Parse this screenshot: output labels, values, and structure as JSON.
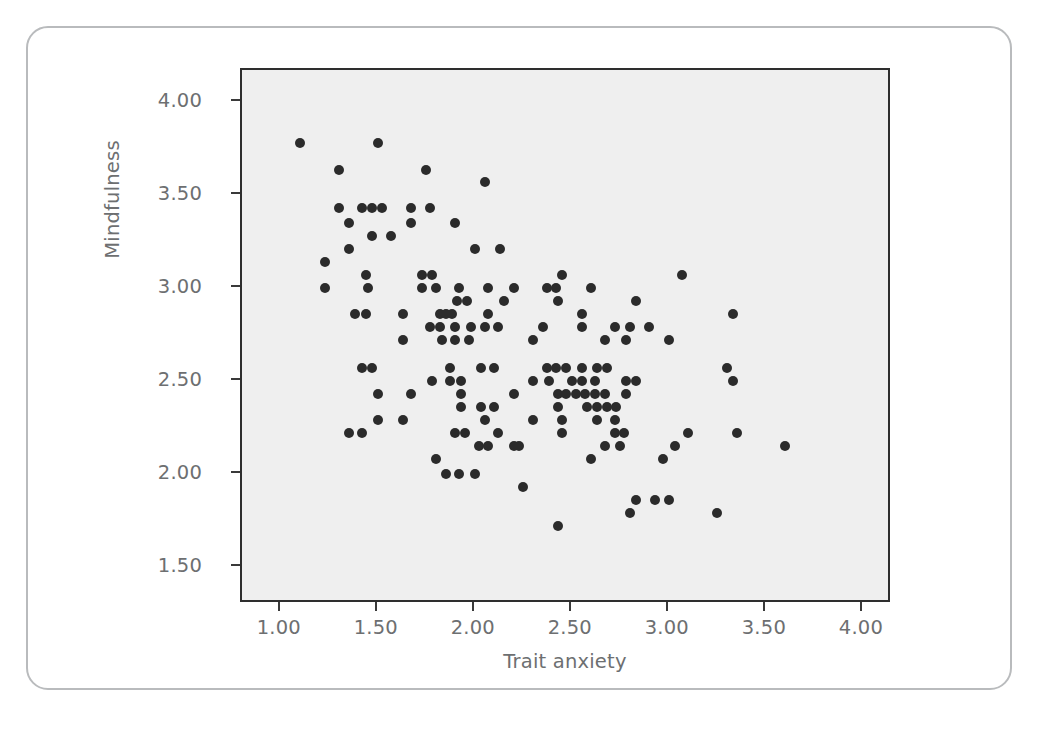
{
  "figure": {
    "background_color": "#ffffff",
    "card_border_color": "#b9bbbd",
    "plot_background_color": "#efefef",
    "axis_color": "#2e2e2e",
    "tick_label_color": "#6d6f71",
    "point_color": "#2b2b2b"
  },
  "chart_data": {
    "type": "scatter",
    "title": "",
    "subtitle": "",
    "xlabel": "Trait anxiety",
    "ylabel": "Mindfulness",
    "xlim": [
      0.8,
      4.15
    ],
    "ylim": [
      1.3,
      4.17
    ],
    "xticks": [
      1.0,
      1.5,
      2.0,
      2.5,
      3.0,
      3.5,
      4.0
    ],
    "xticklabels": [
      "1.00",
      "1.50",
      "2.00",
      "2.50",
      "3.00",
      "3.50",
      "4.00"
    ],
    "yticks": [
      1.5,
      2.0,
      2.5,
      3.0,
      3.5,
      4.0
    ],
    "yticklabels": [
      "1.50",
      "2.00",
      "2.50",
      "3.00",
      "3.50",
      "4.00"
    ],
    "grid": false,
    "legend": null,
    "marker": "circle",
    "marker_size": 10,
    "n_points": 148,
    "points": [
      [
        1.1,
        3.78
      ],
      [
        1.5,
        3.78
      ],
      [
        1.3,
        3.63
      ],
      [
        1.75,
        3.63
      ],
      [
        2.05,
        3.57
      ],
      [
        1.3,
        3.43
      ],
      [
        1.42,
        3.43
      ],
      [
        1.47,
        3.43
      ],
      [
        1.52,
        3.43
      ],
      [
        1.67,
        3.43
      ],
      [
        1.77,
        3.43
      ],
      [
        1.35,
        3.35
      ],
      [
        1.67,
        3.35
      ],
      [
        1.9,
        3.35
      ],
      [
        1.47,
        3.28
      ],
      [
        1.57,
        3.28
      ],
      [
        1.35,
        3.21
      ],
      [
        2.0,
        3.21
      ],
      [
        2.13,
        3.21
      ],
      [
        1.23,
        3.14
      ],
      [
        1.44,
        3.07
      ],
      [
        1.73,
        3.07
      ],
      [
        1.78,
        3.07
      ],
      [
        2.45,
        3.07
      ],
      [
        3.07,
        3.07
      ],
      [
        1.23,
        3.0
      ],
      [
        1.45,
        3.0
      ],
      [
        1.73,
        3.0
      ],
      [
        1.8,
        3.0
      ],
      [
        1.92,
        3.0
      ],
      [
        2.07,
        3.0
      ],
      [
        2.2,
        3.0
      ],
      [
        2.37,
        3.0
      ],
      [
        2.42,
        3.0
      ],
      [
        2.6,
        3.0
      ],
      [
        1.91,
        2.93
      ],
      [
        1.96,
        2.93
      ],
      [
        2.15,
        2.93
      ],
      [
        2.43,
        2.93
      ],
      [
        2.83,
        2.93
      ],
      [
        1.38,
        2.86
      ],
      [
        1.44,
        2.86
      ],
      [
        1.63,
        2.86
      ],
      [
        1.82,
        2.86
      ],
      [
        1.85,
        2.86
      ],
      [
        1.88,
        2.86
      ],
      [
        2.07,
        2.86
      ],
      [
        2.55,
        2.86
      ],
      [
        3.33,
        2.86
      ],
      [
        1.77,
        2.79
      ],
      [
        1.82,
        2.79
      ],
      [
        1.9,
        2.79
      ],
      [
        1.98,
        2.79
      ],
      [
        2.05,
        2.79
      ],
      [
        2.12,
        2.79
      ],
      [
        2.35,
        2.79
      ],
      [
        2.55,
        2.79
      ],
      [
        2.72,
        2.79
      ],
      [
        2.8,
        2.79
      ],
      [
        2.9,
        2.79
      ],
      [
        1.63,
        2.72
      ],
      [
        1.83,
        2.72
      ],
      [
        1.9,
        2.72
      ],
      [
        1.97,
        2.72
      ],
      [
        2.3,
        2.72
      ],
      [
        2.67,
        2.72
      ],
      [
        2.78,
        2.72
      ],
      [
        3.0,
        2.72
      ],
      [
        1.42,
        2.57
      ],
      [
        1.47,
        2.57
      ],
      [
        1.87,
        2.57
      ],
      [
        2.03,
        2.57
      ],
      [
        2.1,
        2.57
      ],
      [
        2.37,
        2.57
      ],
      [
        2.42,
        2.57
      ],
      [
        2.47,
        2.57
      ],
      [
        2.55,
        2.57
      ],
      [
        2.63,
        2.57
      ],
      [
        2.68,
        2.57
      ],
      [
        3.3,
        2.57
      ],
      [
        1.78,
        2.5
      ],
      [
        1.87,
        2.5
      ],
      [
        1.93,
        2.5
      ],
      [
        2.3,
        2.5
      ],
      [
        2.38,
        2.5
      ],
      [
        2.5,
        2.5
      ],
      [
        2.55,
        2.5
      ],
      [
        2.62,
        2.5
      ],
      [
        2.78,
        2.5
      ],
      [
        2.83,
        2.5
      ],
      [
        3.33,
        2.5
      ],
      [
        1.5,
        2.43
      ],
      [
        1.67,
        2.43
      ],
      [
        1.93,
        2.43
      ],
      [
        2.2,
        2.43
      ],
      [
        2.43,
        2.43
      ],
      [
        2.47,
        2.43
      ],
      [
        2.52,
        2.43
      ],
      [
        2.57,
        2.43
      ],
      [
        2.62,
        2.43
      ],
      [
        2.67,
        2.43
      ],
      [
        2.78,
        2.43
      ],
      [
        1.93,
        2.36
      ],
      [
        2.03,
        2.36
      ],
      [
        2.1,
        2.36
      ],
      [
        2.43,
        2.36
      ],
      [
        2.58,
        2.36
      ],
      [
        2.63,
        2.36
      ],
      [
        2.68,
        2.36
      ],
      [
        2.73,
        2.36
      ],
      [
        1.5,
        2.29
      ],
      [
        1.63,
        2.29
      ],
      [
        2.05,
        2.29
      ],
      [
        2.3,
        2.29
      ],
      [
        2.45,
        2.29
      ],
      [
        2.63,
        2.29
      ],
      [
        2.72,
        2.29
      ],
      [
        1.35,
        2.22
      ],
      [
        1.42,
        2.22
      ],
      [
        1.9,
        2.22
      ],
      [
        1.95,
        2.22
      ],
      [
        2.12,
        2.22
      ],
      [
        2.45,
        2.22
      ],
      [
        2.72,
        2.22
      ],
      [
        2.77,
        2.22
      ],
      [
        3.1,
        2.22
      ],
      [
        3.35,
        2.22
      ],
      [
        2.02,
        2.15
      ],
      [
        2.07,
        2.15
      ],
      [
        2.2,
        2.15
      ],
      [
        2.23,
        2.15
      ],
      [
        2.67,
        2.15
      ],
      [
        2.75,
        2.15
      ],
      [
        3.03,
        2.15
      ],
      [
        3.6,
        2.15
      ],
      [
        1.8,
        2.08
      ],
      [
        2.6,
        2.08
      ],
      [
        2.97,
        2.08
      ],
      [
        1.85,
        2.0
      ],
      [
        1.92,
        2.0
      ],
      [
        2.0,
        2.0
      ],
      [
        2.25,
        1.93
      ],
      [
        2.83,
        1.86
      ],
      [
        2.93,
        1.86
      ],
      [
        3.0,
        1.86
      ],
      [
        2.8,
        1.79
      ],
      [
        3.25,
        1.79
      ],
      [
        2.43,
        1.72
      ]
    ]
  }
}
